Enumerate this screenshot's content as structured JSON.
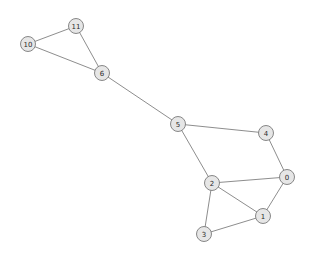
{
  "chart_data": {
    "type": "diagram",
    "subtype": "node-link-graph",
    "title": "",
    "xlabel": "",
    "ylabel": "",
    "background_color": "#ffffff",
    "node_fill_color": "#e6e6e6",
    "node_stroke_color": "#7a7a7a",
    "edge_color": "#808080",
    "label_color": "#2b2b2b",
    "node_radius": 7.5,
    "directed": false,
    "weighted": false,
    "node_count": 9,
    "edge_count": 12,
    "nodes": [
      {
        "id": "0",
        "label": "0",
        "x": 287,
        "y": 177
      },
      {
        "id": "1",
        "label": "1",
        "x": 263,
        "y": 216
      },
      {
        "id": "2",
        "label": "2",
        "x": 212,
        "y": 183
      },
      {
        "id": "3",
        "label": "3",
        "x": 204,
        "y": 234
      },
      {
        "id": "4",
        "label": "4",
        "x": 266,
        "y": 133
      },
      {
        "id": "5",
        "label": "5",
        "x": 178,
        "y": 124
      },
      {
        "id": "6",
        "label": "6",
        "x": 102,
        "y": 73
      },
      {
        "id": "10",
        "label": "10",
        "x": 28,
        "y": 44
      },
      {
        "id": "11",
        "label": "11",
        "x": 76,
        "y": 26
      }
    ],
    "edges": [
      {
        "source": "10",
        "target": "11"
      },
      {
        "source": "10",
        "target": "6"
      },
      {
        "source": "11",
        "target": "6"
      },
      {
        "source": "6",
        "target": "5"
      },
      {
        "source": "5",
        "target": "4"
      },
      {
        "source": "5",
        "target": "2"
      },
      {
        "source": "4",
        "target": "0"
      },
      {
        "source": "2",
        "target": "0"
      },
      {
        "source": "2",
        "target": "1"
      },
      {
        "source": "2",
        "target": "3"
      },
      {
        "source": "3",
        "target": "1"
      },
      {
        "source": "1",
        "target": "0"
      }
    ]
  }
}
